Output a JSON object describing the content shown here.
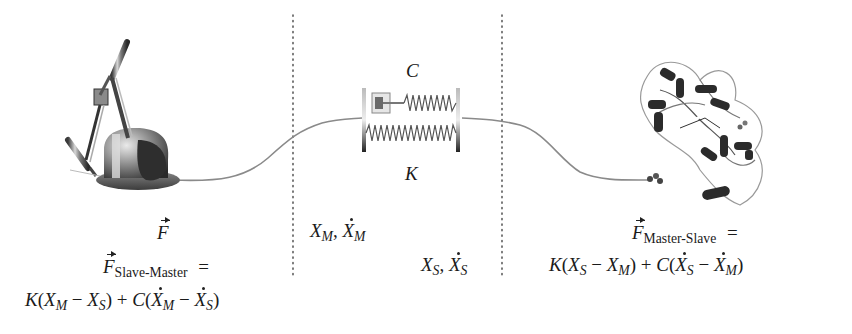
{
  "diagram": {
    "type": "teleoperation-coupling",
    "sections": [
      {
        "id": "master",
        "label": "haptic device (master)"
      },
      {
        "id": "coupling",
        "label": "spring-damper virtual coupling"
      },
      {
        "id": "slave",
        "label": "protein molecule (slave)"
      }
    ],
    "dividers": [
      {
        "x": 293
      },
      {
        "x": 502
      }
    ],
    "coupling": {
      "damper_label": "C",
      "spring_label": "K"
    },
    "left": {
      "force_label": "F",
      "eq_line1_F": "F",
      "eq_line1_sub": "Slave-Master",
      "eq_line1_eq": "=",
      "eq_line2": {
        "K": "K",
        "open1": "(",
        "X1": "X",
        "X1sub": "M",
        "minus1": "−",
        "X2": "X",
        "X2sub": "S",
        "close1": ")",
        "plus": "+",
        "C": "C",
        "open2": "(",
        "Xd1": "X",
        "Xd1sub": "M",
        "minus2": "−",
        "Xd2": "X",
        "Xd2sub": "S",
        "close2": ")"
      }
    },
    "middle": {
      "master_state": {
        "X": "X",
        "sub": "M",
        "comma": ",",
        "Xd": "X",
        "subd": "M"
      },
      "slave_state": {
        "X": "X",
        "sub": "S",
        "comma": ",",
        "Xd": "X",
        "subd": "S"
      }
    },
    "right": {
      "eq_line1_F": "F",
      "eq_line1_sub": "Master-Slave",
      "eq_line1_eq": "=",
      "eq_line2": {
        "K": "K",
        "open1": "(",
        "X1": "X",
        "X1sub": "S",
        "minus1": "−",
        "X2": "X",
        "X2sub": "M",
        "close1": ")",
        "plus": "+",
        "C": "C",
        "open2": "(",
        "Xd1": "X",
        "Xd1sub": "S",
        "minus2": "−",
        "Xd2": "X",
        "Xd2sub": "M",
        "close2": ")"
      }
    }
  }
}
